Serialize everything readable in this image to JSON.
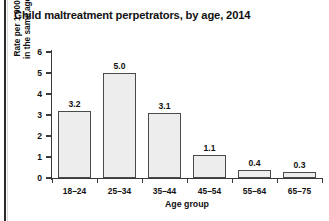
{
  "chart_data": {
    "type": "bar",
    "title": "Child maltreatment perpetrators, by age, 2014",
    "xlabel": "Age group",
    "ylabel_line1": "Rate per 1,000 adults",
    "ylabel_line2": "in the same age group",
    "categories": [
      "18–24",
      "25–34",
      "35–44",
      "45–54",
      "55–64",
      "65–75"
    ],
    "values": [
      3.2,
      5.0,
      3.1,
      1.1,
      0.4,
      0.3
    ],
    "value_labels": [
      "3.2",
      "5.0",
      "3.1",
      "1.1",
      "0.4",
      "0.3"
    ],
    "ylim": [
      0,
      6
    ],
    "yticks": [
      0,
      1,
      2,
      3,
      4,
      5,
      6
    ],
    "ytick_labels": [
      "0",
      "1",
      "2",
      "3",
      "4",
      "5",
      "6"
    ],
    "grid": false,
    "legend": "none",
    "bar_fill_color": "#ededed",
    "bar_edge_color": "#4a4a4a",
    "axis_color": "#3a3a3a",
    "text_color": "#111111",
    "background_color": "#ffffff"
  }
}
